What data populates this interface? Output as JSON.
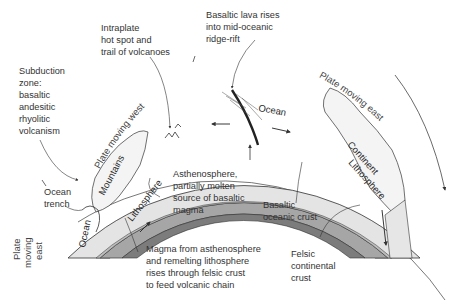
{
  "diagram": {
    "type": "plate-tectonics-cross-section",
    "labels": {
      "hotspot": [
        "Intraplate",
        "hot spot and",
        "trail of volcanoes"
      ],
      "ridge": [
        "Basaltic lava rises",
        "into mid-oceanic",
        "ridge-rift"
      ],
      "subduction": [
        "Subduction",
        "zone:",
        "basaltic",
        "andesitic",
        "rhyolitic",
        "volcanism"
      ],
      "trench": [
        "Ocean",
        "trench"
      ],
      "asthenosphere": [
        "Asthenosphere,",
        "partially molten",
        "source of basaltic",
        "magma"
      ],
      "basaltic_crust": [
        "Basaltic",
        "oceanic crust"
      ],
      "magma": [
        "Magma from asthenosphere",
        "and remelting lithosphere",
        "rises through felsic crust",
        "to feed volcanic chain"
      ],
      "felsic_crust": [
        "Felsic",
        "continental",
        "crust"
      ]
    },
    "arc_labels": {
      "plate_west": "Plate moving west",
      "plate_east_right": "Plate moving east",
      "plate_east_left": [
        "Plate",
        "moving",
        "east"
      ]
    },
    "region_labels": {
      "ocean_top": "Ocean",
      "ocean_left": "Ocean",
      "continent": "Continent",
      "mountains": "Mountains",
      "lithosphere_left": "Lithosphere",
      "lithosphere_right": "Lithosphere"
    },
    "colors": {
      "ocean": "#e4e4e4",
      "lithosphere": "#a6a6a6",
      "asthenosphere": "#7c7c7c",
      "crust_band": "#bdbdbd",
      "continent": "#f4f4f4",
      "outline": "#333333"
    }
  }
}
